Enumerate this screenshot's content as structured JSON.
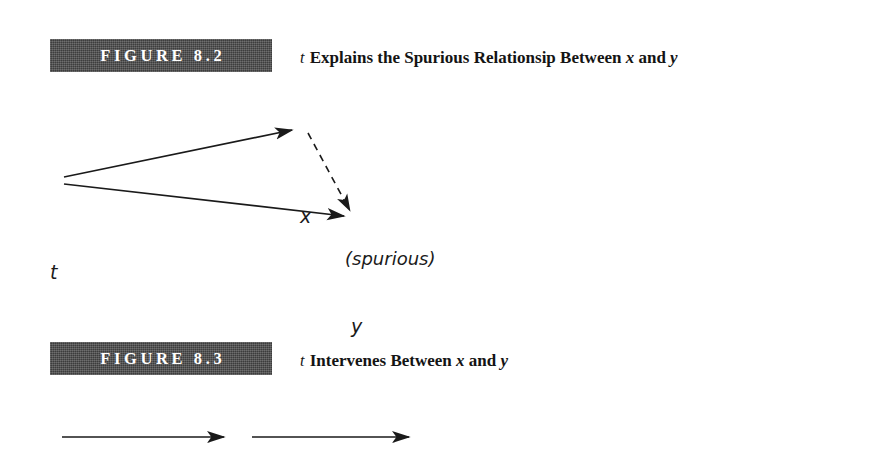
{
  "page": {
    "background": "#ffffff",
    "banner_color": "#4a4a4a",
    "ink_color": "#1a1a1a"
  },
  "figures": [
    {
      "id": "figure-8-2",
      "banner_label": "FIGURE 8.2",
      "caption": {
        "lead_variable": "t",
        "text_before": " Explains the Spurious Relationsip Between ",
        "var_x": "x",
        "text_between": " and ",
        "var_y": "y"
      },
      "diagram": {
        "type": "causal-triangle",
        "nodes": [
          {
            "name": "node-t",
            "label": "t",
            "x": 53,
            "y": 172
          },
          {
            "name": "node-x",
            "label": "x",
            "x": 302,
            "y": 114
          },
          {
            "name": "node-y",
            "label": "y",
            "x": 353,
            "y": 225
          }
        ],
        "edges": [
          {
            "name": "edge-t-to-x",
            "from": "t",
            "to": "x",
            "style": "solid",
            "arrow": true
          },
          {
            "name": "edge-t-to-y",
            "from": "t",
            "to": "y",
            "style": "solid",
            "arrow": true
          },
          {
            "name": "edge-x-to-y",
            "from": "x",
            "to": "y",
            "style": "dashed",
            "arrow": true,
            "label": "(spurious)"
          }
        ],
        "annotation": "(spurious)"
      }
    },
    {
      "id": "figure-8-3",
      "banner_label": "FIGURE 8.3",
      "caption": {
        "lead_variable": "t",
        "text_before": " Intervenes Between ",
        "var_x": "x",
        "text_between": " and ",
        "var_y": "y"
      },
      "diagram": {
        "type": "causal-chain",
        "nodes": [
          {
            "name": "node-x",
            "label": "x",
            "x": 45,
            "y": 428
          },
          {
            "name": "node-t",
            "label": "t",
            "x": 236,
            "y": 428
          },
          {
            "name": "node-y",
            "label": "y",
            "x": 419,
            "y": 428
          }
        ],
        "edges": [
          {
            "name": "edge-x-to-t",
            "from": "x",
            "to": "t",
            "style": "solid",
            "arrow": true
          },
          {
            "name": "edge-t-to-y",
            "from": "t",
            "to": "y",
            "style": "solid",
            "arrow": true
          }
        ]
      }
    }
  ]
}
